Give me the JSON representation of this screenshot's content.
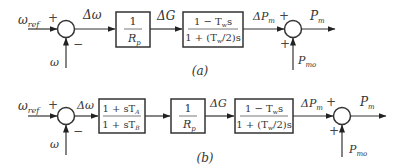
{
  "diagram_a": {
    "caption": "(a)",
    "input_ref": {
      "base": "ω",
      "sub": "ref"
    },
    "input_feedback": "ω",
    "sum1_signs": {
      "top": "+",
      "bottom": "−"
    },
    "error_signal": "Δω",
    "block_gain": {
      "numerator": "1",
      "denominator": "R",
      "den_sub": "p"
    },
    "signal_gate": "ΔG",
    "block_turbine": {
      "numerator": "1 − T",
      "num_sub": "w",
      "num_tail": "s",
      "denominator": "1 + (T",
      "den_sub": "w",
      "den_tail": "/2)s"
    },
    "signal_dpm": {
      "base": "ΔP",
      "sub": "m"
    },
    "sum2_signs": {
      "top": "+",
      "bottom": "+"
    },
    "output": {
      "base": "P",
      "sub": "m"
    },
    "input_pm0": {
      "base": "P",
      "sub": "mo"
    }
  },
  "diagram_b": {
    "caption": "(b)",
    "input_ref": {
      "base": "ω",
      "sub": "ref"
    },
    "input_feedback": "ω",
    "sum1_signs": {
      "top": "+",
      "bottom": "−"
    },
    "error_signal": "Δω",
    "block_leadlag": {
      "numerator": "1 + sT",
      "num_sub": "A",
      "denominator": "1 + sT",
      "den_sub": "B"
    },
    "block_gain": {
      "numerator": "1",
      "denominator": "R",
      "den_sub": "p"
    },
    "signal_gate": "ΔG",
    "block_turbine": {
      "numerator": "1 − T",
      "num_sub": "w",
      "num_tail": "s",
      "denominator": "1 + (T",
      "den_sub": "w",
      "den_tail": "/2)s"
    },
    "signal_dpm": {
      "base": "ΔP",
      "sub": "m"
    },
    "sum2_signs": {
      "top": "+",
      "bottom": "+"
    },
    "output": {
      "base": "P",
      "sub": "m"
    },
    "input_pm0": {
      "base": "P",
      "sub": "mo"
    }
  }
}
